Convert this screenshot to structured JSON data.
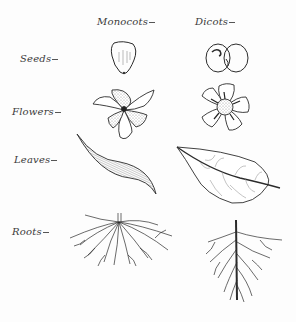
{
  "diagram": {
    "columns": [
      {
        "id": "monocots",
        "label": "Monocots"
      },
      {
        "id": "dicots",
        "label": "Dicots"
      }
    ],
    "rows": [
      {
        "id": "seeds",
        "label": "Seeds",
        "monocots": "single cotyledon seed with parallel striations",
        "dicots": "seed with two cotyledons and embryo"
      },
      {
        "id": "flowers",
        "label": "Flowers",
        "monocots": "flower with petals in multiples of three (stippled and plain)",
        "dicots": "five-petaled flower with dense center"
      },
      {
        "id": "leaves",
        "label": "Leaves",
        "monocots": "narrow leaf with parallel veins",
        "dicots": "broad leaf with netted veins and midrib"
      },
      {
        "id": "roots",
        "label": "Roots",
        "monocots": "fibrous root system",
        "dicots": "taproot system with branching laterals"
      }
    ],
    "colors": {
      "ink": "#2b2b2b",
      "paper": "#fdfdfd",
      "stipple": "#9a9a9a"
    }
  }
}
